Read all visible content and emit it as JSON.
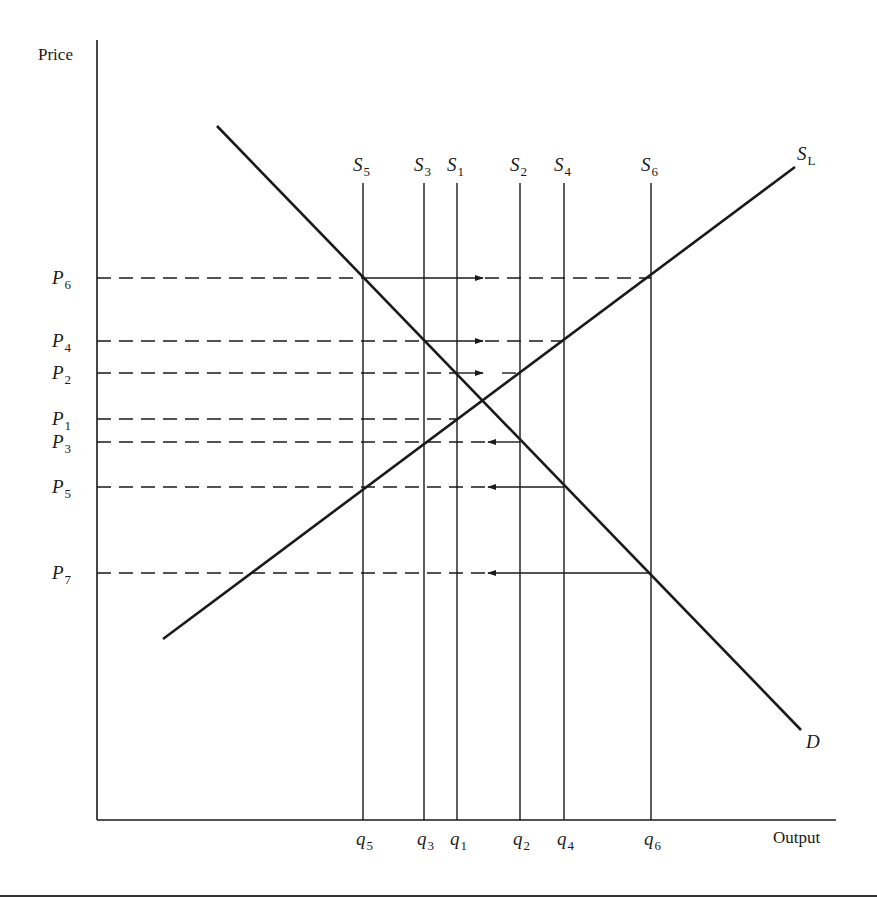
{
  "axes": {
    "y_label": "Price",
    "x_label": "Output"
  },
  "curves": {
    "demand": {
      "label": "D",
      "from": [
        217,
        126
      ],
      "to": [
        801,
        730
      ]
    },
    "long_run_supply": {
      "label": "S",
      "subscript": "L",
      "from": [
        163,
        639
      ],
      "to": [
        795,
        167
      ]
    }
  },
  "short_run_supplies": [
    {
      "id": "S5",
      "label": "S",
      "sub": "5",
      "x": 363,
      "q_label": "q",
      "q_sub": "5"
    },
    {
      "id": "S3",
      "label": "S",
      "sub": "3",
      "x": 424,
      "q_label": "q",
      "q_sub": "3"
    },
    {
      "id": "S1",
      "label": "S",
      "sub": "1",
      "x": 457,
      "q_label": "q",
      "q_sub": "1"
    },
    {
      "id": "S2",
      "label": "S",
      "sub": "2",
      "x": 520,
      "q_label": "q",
      "q_sub": "2"
    },
    {
      "id": "S4",
      "label": "S",
      "sub": "4",
      "x": 564,
      "q_label": "q",
      "q_sub": "4"
    },
    {
      "id": "S6",
      "label": "S",
      "sub": "6",
      "x": 651,
      "q_label": "q",
      "q_sub": "6"
    }
  ],
  "price_levels": [
    {
      "id": "P6",
      "label": "P",
      "sub": "6",
      "y": 278
    },
    {
      "id": "P4",
      "label": "P",
      "sub": "4",
      "y": 341
    },
    {
      "id": "P2",
      "label": "P",
      "sub": "2",
      "y": 373
    },
    {
      "id": "P1",
      "label": "P",
      "sub": "1",
      "y": 419
    },
    {
      "id": "P3",
      "label": "P",
      "sub": "3",
      "y": 442
    },
    {
      "id": "P5",
      "label": "P",
      "sub": "5",
      "y": 487
    },
    {
      "id": "P7",
      "label": "P",
      "sub": "7",
      "y": 573
    }
  ],
  "price_guides": [
    {
      "level": "P6",
      "dash_to": 363,
      "solid_from": 363,
      "solid_to": 483,
      "dir": "right",
      "dash2_from": 483,
      "dash2_to": 651
    },
    {
      "level": "P4",
      "dash_to": 424,
      "solid_from": 424,
      "solid_to": 483,
      "dir": "right",
      "dash2_from": 483,
      "dash2_to": 564
    },
    {
      "level": "P2",
      "dash_to": 457,
      "solid_from": 457,
      "solid_to": 483,
      "dir": "right",
      "dash2_from": 500,
      "dash2_to": 520
    },
    {
      "level": "P1",
      "dash_to": 457,
      "solid_from": null,
      "solid_to": null,
      "dir": "none",
      "dash2_from": null,
      "dash2_to": null
    },
    {
      "level": "P3",
      "dash_to": 488,
      "solid_from": 488,
      "solid_to": 520,
      "dir": "left",
      "dash2_from": null,
      "dash2_to": null
    },
    {
      "level": "P5",
      "dash_to": 488,
      "solid_from": 488,
      "solid_to": 564,
      "dir": "left",
      "dash2_from": null,
      "dash2_to": null
    },
    {
      "level": "P7",
      "dash_to": 488,
      "solid_from": 488,
      "solid_to": 651,
      "dir": "left",
      "dash2_from": null,
      "dash2_to": null
    }
  ],
  "layout": {
    "origin": [
      97,
      820
    ],
    "y_axis_top": 40,
    "x_axis_right": 836,
    "supply_top": 183,
    "rule_y": 896,
    "line_color": "#1a1a1a"
  }
}
